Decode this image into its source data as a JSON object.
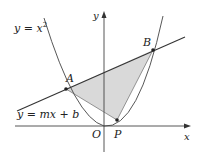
{
  "diagram": {
    "curve_label": "y = x",
    "curve_exponent": "2",
    "line_label": "y = mx + b",
    "points": {
      "A": "A",
      "B": "B",
      "O": "O",
      "P": "P"
    },
    "axes": {
      "x_label": "x",
      "y_label": "y"
    },
    "colors": {
      "shade": "#d9d9d9",
      "stroke": "#333333",
      "axis": "#444444"
    }
  }
}
